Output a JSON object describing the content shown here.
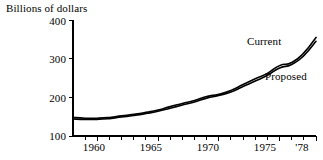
{
  "chart_data": {
    "type": "line",
    "title": "Billions of dollars",
    "xlabel": "",
    "ylabel": "Billions of dollars",
    "grid": false,
    "legend_position": "inline-right",
    "xlim": [
      1958,
      1978
    ],
    "ylim": [
      100,
      400
    ],
    "yticks": [
      100,
      200,
      300,
      400
    ],
    "ytick_labels": [
      "100",
      "200",
      "300",
      "400"
    ],
    "xticks": [
      1958,
      1959,
      1960,
      1961,
      1962,
      1963,
      1964,
      1965,
      1966,
      1967,
      1968,
      1969,
      1970,
      1971,
      1972,
      1973,
      1974,
      1975,
      1976,
      1977,
      1978
    ],
    "xtick_labels_shown": [
      {
        "value": 1960,
        "label": "1960"
      },
      {
        "value": 1965,
        "label": "1965"
      },
      {
        "value": 1970,
        "label": "1970"
      },
      {
        "value": 1975,
        "label": "1975"
      },
      {
        "value": 1978,
        "label": "'78"
      }
    ],
    "x": [
      1958,
      1959,
      1960,
      1961,
      1962,
      1963,
      1964,
      1965,
      1966,
      1967,
      1968,
      1969,
      1970,
      1971,
      1972,
      1973,
      1974,
      1975,
      1976,
      1977,
      1978
    ],
    "series": [
      {
        "name": "Current",
        "color": "#000000",
        "values": [
          148,
          146,
          146,
          148,
          152,
          156,
          161,
          167,
          176,
          184,
          192,
          202,
          208,
          218,
          233,
          248,
          262,
          282,
          290,
          315,
          355
        ]
      },
      {
        "name": "Proposed",
        "color": "#000000",
        "values": [
          144,
          143,
          143,
          145,
          149,
          153,
          158,
          164,
          172,
          180,
          188,
          198,
          205,
          214,
          228,
          242,
          257,
          276,
          285,
          308,
          345
        ]
      }
    ],
    "annotations": [
      {
        "text": "Current",
        "x": 1974.1,
        "y": 332
      },
      {
        "text": "Proposed",
        "x": 1975.0,
        "y": 250
      }
    ]
  },
  "axis": {
    "y_title": "Billions of dollars",
    "y_labels": [
      "400",
      "300",
      "200",
      "100"
    ],
    "x_labels": [
      "1960",
      "1965",
      "1970",
      "1975",
      "'78"
    ]
  },
  "legend": {
    "current_label": "Current",
    "proposed_label": "Proposed"
  }
}
